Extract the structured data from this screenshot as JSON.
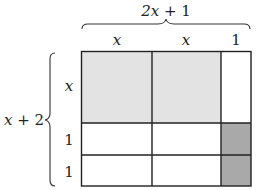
{
  "diagram": {
    "type": "area-model",
    "top_dimension": {
      "label_var": "2x",
      "label_rest": " + 1"
    },
    "side_dimension": {
      "label_var": "x",
      "label_rest": " + 2"
    },
    "column_labels": [
      {
        "text": "x",
        "italic": true
      },
      {
        "text": "x",
        "italic": true
      },
      {
        "text": "1",
        "italic": false
      }
    ],
    "row_labels": [
      {
        "text": "x",
        "italic": true
      },
      {
        "text": "1",
        "italic": false
      },
      {
        "text": "1",
        "italic": false
      }
    ],
    "cells": [
      [
        "light",
        "light",
        "white"
      ],
      [
        "white",
        "white",
        "dark"
      ],
      [
        "white",
        "white",
        "dark"
      ]
    ],
    "colors": {
      "light": "#e3e3e3",
      "dark": "#a9a9a9",
      "white": "#ffffff",
      "line": "#222222"
    }
  }
}
